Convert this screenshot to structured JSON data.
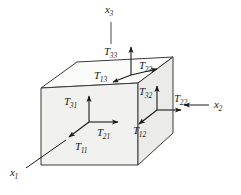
{
  "figure": {
    "colors": {
      "face_fill": "#f1f1ef",
      "top_face_fill": "#fafafa",
      "right_face_fill": "#ececea",
      "outline": "#3a3a3a",
      "arrow": "#1a1a1a",
      "text": "#1a1a1a",
      "background": "#ffffff"
    }
  },
  "axes": [
    {
      "id": "x3",
      "base": "x",
      "sub": "3",
      "direction": "up",
      "x": 105,
      "y": 4
    },
    {
      "id": "x2",
      "base": "x",
      "sub": "2",
      "direction": "right",
      "x": 214,
      "y": 104
    },
    {
      "id": "x1",
      "base": "x",
      "sub": "1",
      "direction": "down-left",
      "x": 10,
      "y": 170
    }
  ],
  "faces": [
    {
      "name": "front-face",
      "normal": "x1",
      "origin": {
        "x": 89,
        "y": 122
      },
      "components": [
        {
          "id": "T31",
          "base": "T",
          "sub": "31",
          "direction": "up",
          "x": 64,
          "y": 96
        },
        {
          "id": "T21",
          "base": "T",
          "sub": "21",
          "direction": "right",
          "x": 97,
          "y": 127
        },
        {
          "id": "T11",
          "base": "T",
          "sub": "11",
          "direction": "down-left",
          "x": 75,
          "y": 141
        }
      ]
    },
    {
      "name": "top-face",
      "normal": "x3",
      "origin": {
        "x": 131,
        "y": 75
      },
      "components": [
        {
          "id": "T33",
          "base": "T",
          "sub": "33",
          "direction": "up",
          "x": 104,
          "y": 46
        },
        {
          "id": "T23",
          "base": "T",
          "sub": "23",
          "direction": "right",
          "x": 139,
          "y": 60
        },
        {
          "id": "T13",
          "base": "T",
          "sub": "13",
          "direction": "down-left",
          "x": 94,
          "y": 70
        }
      ]
    },
    {
      "name": "right-face",
      "normal": "x2",
      "origin": {
        "x": 157,
        "y": 110
      },
      "components": [
        {
          "id": "T32",
          "base": "T",
          "sub": "32",
          "direction": "up",
          "x": 139,
          "y": 86
        },
        {
          "id": "T22",
          "base": "T",
          "sub": "22",
          "direction": "right",
          "x": 174,
          "y": 96
        },
        {
          "id": "T12",
          "base": "T",
          "sub": "12",
          "direction": "down-left",
          "x": 133,
          "y": 125
        }
      ]
    }
  ]
}
